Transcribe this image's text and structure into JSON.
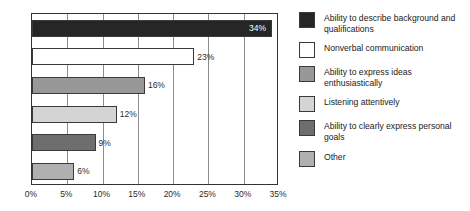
{
  "chart_data": {
    "type": "bar",
    "orientation": "horizontal",
    "title": "",
    "xlabel": "",
    "ylabel": "",
    "xlim": [
      0,
      35
    ],
    "grid": true,
    "legend_position": "right",
    "x_tick_labels": [
      "0%",
      "5%",
      "10%",
      "15%",
      "20%",
      "25%",
      "30%",
      "35%"
    ],
    "x_tick_values": [
      0,
      5,
      10,
      15,
      20,
      25,
      30,
      35
    ],
    "categories": [
      "Ability to describe background and qualifications",
      "Nonverbal communication",
      "Ability to express ideas enthusiastically",
      "Listening attentively",
      "Ability to clearly express personal goals",
      "Other"
    ],
    "values": [
      34,
      23,
      16,
      12,
      9,
      6
    ],
    "value_labels": [
      "34%",
      "23%",
      "16%",
      "12%",
      "9%",
      "6%"
    ],
    "label_placement": [
      "inside",
      "outside",
      "outside",
      "outside",
      "outside",
      "outside"
    ],
    "colors": [
      "#262626",
      "#ffffff",
      "#989898",
      "#d4d4d4",
      "#6e6e6e",
      "#b0b0b0"
    ],
    "bar_border_color": "#3a3a3a",
    "plot_border_color": "#333333",
    "gridline_color": "#8c8c8c"
  },
  "legend": {
    "items": [
      {
        "label": "Ability to describe background and qualifications",
        "color": "#262626"
      },
      {
        "label": "Nonverbal communication",
        "color": "#ffffff"
      },
      {
        "label": "Ability to express ideas enthusiastically",
        "color": "#989898"
      },
      {
        "label": "Listening attentively",
        "color": "#d4d4d4"
      },
      {
        "label": "Ability to clearly express personal goals",
        "color": "#6e6e6e"
      },
      {
        "label": "Other",
        "color": "#b0b0b0"
      }
    ]
  }
}
